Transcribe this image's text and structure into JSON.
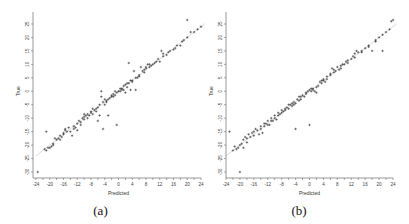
{
  "figure": {
    "captions": [
      "(a)",
      "(b)"
    ]
  },
  "chart_data": [
    {
      "type": "scatter",
      "title": "",
      "panel_label": "(a)",
      "xlabel": "Predicted",
      "ylabel": "True",
      "xlim": [
        -24,
        26
      ],
      "ylim": [
        -32,
        27
      ],
      "xticks": [
        -24,
        -20,
        -16,
        -12,
        -8,
        -4,
        0,
        4,
        8,
        12,
        16,
        20,
        24
      ],
      "yticks": [
        -30,
        -25,
        -20,
        -15,
        -10,
        -5,
        0,
        5,
        10,
        15,
        20,
        25
      ],
      "grid": false,
      "reference_line": "y = x",
      "points": [
        [
          -23.5,
          -30
        ],
        [
          -21,
          -15
        ],
        [
          -21.5,
          -21.5
        ],
        [
          -21,
          -22
        ],
        [
          -20.5,
          -21
        ],
        [
          -20,
          -21
        ],
        [
          -19.5,
          -20.5
        ],
        [
          -19,
          -20
        ],
        [
          -19,
          -19.5
        ],
        [
          -18,
          -18
        ],
        [
          -17.5,
          -17.5
        ],
        [
          -17,
          -16.5
        ],
        [
          -16.5,
          -17
        ],
        [
          -16,
          -16
        ],
        [
          -16,
          -15.5
        ],
        [
          -15.5,
          -14.5
        ],
        [
          -15,
          -15
        ],
        [
          -14.5,
          -13.5
        ],
        [
          -14,
          -15
        ],
        [
          -13.5,
          -16.5
        ],
        [
          -13,
          -14
        ],
        [
          -12.5,
          -13.5
        ],
        [
          -12,
          -12
        ],
        [
          -11.5,
          -11
        ],
        [
          -11,
          -11.5
        ],
        [
          -10.5,
          -10
        ],
        [
          -10,
          -8.5
        ],
        [
          -10,
          -10.5
        ],
        [
          -9.5,
          -9
        ],
        [
          -9,
          -10
        ],
        [
          -8.5,
          -9
        ],
        [
          -8,
          -8
        ],
        [
          -7.5,
          -8.5
        ],
        [
          -7,
          -7
        ],
        [
          -6.5,
          -7.5
        ],
        [
          -6,
          -6
        ],
        [
          -6,
          -11
        ],
        [
          -5.5,
          -5
        ],
        [
          -5.5,
          -9
        ],
        [
          -5,
          -2
        ],
        [
          -5,
          0
        ],
        [
          -4.5,
          -4
        ],
        [
          -4.5,
          -14
        ],
        [
          -4,
          -3
        ],
        [
          -3.5,
          -3.5
        ],
        [
          -3,
          -3
        ],
        [
          -3,
          -9
        ],
        [
          -2.5,
          -2.5
        ],
        [
          -2,
          -2
        ],
        [
          -1.5,
          -1
        ],
        [
          -1,
          -1.5
        ],
        [
          -0.5,
          -0.5
        ],
        [
          -0.5,
          -12.5
        ],
        [
          0,
          0
        ],
        [
          0.5,
          1
        ],
        [
          1,
          0.5
        ],
        [
          1.5,
          2
        ],
        [
          2,
          -0.5
        ],
        [
          2.5,
          1.5
        ],
        [
          3,
          3
        ],
        [
          3,
          10.5
        ],
        [
          3.5,
          4
        ],
        [
          3.5,
          0.5
        ],
        [
          4,
          4
        ],
        [
          4.5,
          7.5
        ],
        [
          5,
          5
        ],
        [
          5,
          0.5
        ],
        [
          6,
          6
        ],
        [
          6.5,
          9
        ],
        [
          7,
          7.5
        ],
        [
          7.5,
          8
        ],
        [
          8,
          8.5
        ],
        [
          8.5,
          10
        ],
        [
          9,
          10
        ],
        [
          9.5,
          9.5
        ],
        [
          10,
          10
        ],
        [
          11,
          11
        ],
        [
          11.5,
          12
        ],
        [
          12,
          11
        ],
        [
          12.5,
          15
        ],
        [
          13,
          13
        ],
        [
          14,
          13.5
        ],
        [
          15,
          15
        ],
        [
          16,
          15.5
        ],
        [
          17,
          17
        ],
        [
          18,
          17
        ],
        [
          19,
          19
        ],
        [
          20,
          20
        ],
        [
          20,
          26.5
        ],
        [
          21,
          22
        ],
        [
          22,
          22
        ],
        [
          23,
          23
        ],
        [
          24,
          24
        ],
        [
          -18.5,
          -17.5
        ],
        [
          -17,
          -18
        ],
        [
          -15.5,
          -14
        ],
        [
          -13,
          -13
        ],
        [
          -11,
          -12.5
        ],
        [
          -9,
          -8.5
        ],
        [
          -7.5,
          -6.5
        ],
        [
          -6.5,
          -6.5
        ],
        [
          -4,
          -5
        ],
        [
          -2,
          -1.5
        ],
        [
          -1,
          0
        ],
        [
          0.5,
          0
        ],
        [
          1.5,
          0.5
        ],
        [
          2.5,
          3
        ],
        [
          4,
          3.5
        ],
        [
          6,
          5.5
        ],
        [
          7.5,
          7
        ],
        [
          9,
          9
        ],
        [
          10.5,
          10.5
        ],
        [
          13,
          14
        ],
        [
          14.5,
          14.5
        ],
        [
          16.5,
          16
        ],
        [
          18.5,
          18.5
        ],
        [
          -12,
          -14.5
        ],
        [
          -10,
          -9.5
        ],
        [
          -8,
          -7.5
        ],
        [
          -3.5,
          -4
        ],
        [
          -1.5,
          -2
        ],
        [
          1,
          1
        ],
        [
          2,
          2.5
        ],
        [
          5.5,
          5
        ],
        [
          8,
          9
        ]
      ]
    },
    {
      "type": "scatter",
      "title": "",
      "panel_label": "(b)",
      "xlabel": "Predicted",
      "ylabel": "True",
      "xlim": [
        -24,
        25
      ],
      "ylim": [
        -32,
        28
      ],
      "xticks": [
        -24,
        -20,
        -16,
        -12,
        -8,
        -4,
        0,
        4,
        8,
        12,
        16,
        20,
        24
      ],
      "yticks": [
        -30,
        -25,
        -20,
        -15,
        -10,
        -5,
        0,
        5,
        10,
        15,
        20,
        25
      ],
      "grid": false,
      "reference_line": "y = x",
      "points": [
        [
          -20,
          -30
        ],
        [
          -23,
          -15
        ],
        [
          -22,
          -22
        ],
        [
          -21,
          -21.5
        ],
        [
          -20.5,
          -21
        ],
        [
          -20,
          -20
        ],
        [
          -19.5,
          -19.5
        ],
        [
          -19,
          -18
        ],
        [
          -19,
          -21
        ],
        [
          -18.5,
          -17
        ],
        [
          -18,
          -17.5
        ],
        [
          -17.5,
          -16
        ],
        [
          -17,
          -17
        ],
        [
          -16.5,
          -15.5
        ],
        [
          -16,
          -15
        ],
        [
          -15.5,
          -14
        ],
        [
          -15,
          -14.5
        ],
        [
          -14.5,
          -16
        ],
        [
          -14,
          -13
        ],
        [
          -13.5,
          -15.5
        ],
        [
          -13,
          -13
        ],
        [
          -12.5,
          -12
        ],
        [
          -12,
          -11
        ],
        [
          -11.5,
          -12.5
        ],
        [
          -11,
          -10
        ],
        [
          -10.5,
          -11
        ],
        [
          -10,
          -9
        ],
        [
          -9.5,
          -10.5
        ],
        [
          -9,
          -9
        ],
        [
          -8.5,
          -8.5
        ],
        [
          -8,
          -8
        ],
        [
          -7.5,
          -7.5
        ],
        [
          -7,
          -7
        ],
        [
          -6.5,
          -6
        ],
        [
          -6,
          -6.5
        ],
        [
          -5.5,
          -5
        ],
        [
          -5,
          -5.5
        ],
        [
          -4.5,
          -4
        ],
        [
          -4,
          -4.5
        ],
        [
          -4,
          -14
        ],
        [
          -3.5,
          -3
        ],
        [
          -3,
          -2
        ],
        [
          -2.5,
          -3
        ],
        [
          -2,
          -1.5
        ],
        [
          -1.5,
          -2
        ],
        [
          -1,
          -1
        ],
        [
          -0.5,
          0
        ],
        [
          0,
          0.5
        ],
        [
          0,
          -12.5
        ],
        [
          0.5,
          0
        ],
        [
          1,
          1
        ],
        [
          1.5,
          0
        ],
        [
          2,
          -0.5
        ],
        [
          2.5,
          2
        ],
        [
          3,
          3.5
        ],
        [
          3.5,
          4
        ],
        [
          4,
          4
        ],
        [
          4.5,
          3.5
        ],
        [
          5,
          4.5
        ],
        [
          6,
          6
        ],
        [
          6.5,
          8.5
        ],
        [
          7,
          7
        ],
        [
          7.5,
          7.5
        ],
        [
          8,
          9
        ],
        [
          8.5,
          8
        ],
        [
          9,
          9.5
        ],
        [
          9.5,
          10
        ],
        [
          10,
          10
        ],
        [
          10.5,
          11
        ],
        [
          11,
          11.5
        ],
        [
          12,
          12
        ],
        [
          12.5,
          13
        ],
        [
          13,
          14
        ],
        [
          13.5,
          15
        ],
        [
          14,
          14.5
        ],
        [
          15,
          15
        ],
        [
          16,
          16
        ],
        [
          17,
          17
        ],
        [
          18,
          15
        ],
        [
          19,
          19
        ],
        [
          20,
          20
        ],
        [
          21,
          15
        ],
        [
          22,
          22
        ],
        [
          23,
          23
        ],
        [
          23.5,
          26
        ],
        [
          24,
          26.5
        ],
        [
          -21.5,
          -20.5
        ],
        [
          -18,
          -19
        ],
        [
          -16,
          -16.5
        ],
        [
          -14,
          -14
        ],
        [
          -12,
          -12.5
        ],
        [
          -10,
          -10
        ],
        [
          -8,
          -7
        ],
        [
          -6,
          -5
        ],
        [
          -4.5,
          -5
        ],
        [
          -2.5,
          -2
        ],
        [
          -1,
          -0.5
        ],
        [
          1,
          0.5
        ],
        [
          2,
          1.5
        ],
        [
          3.5,
          3
        ],
        [
          5,
          5.5
        ],
        [
          7,
          8
        ],
        [
          9,
          8.5
        ],
        [
          11,
          10.5
        ],
        [
          13,
          12.5
        ],
        [
          15,
          14.5
        ],
        [
          17,
          16.5
        ],
        [
          19,
          18.5
        ],
        [
          21,
          21
        ],
        [
          -13,
          -12
        ],
        [
          -11,
          -11
        ],
        [
          -9,
          -8
        ],
        [
          -7,
          -6.5
        ],
        [
          -5,
          -4.5
        ],
        [
          -3,
          -3.5
        ],
        [
          0.5,
          1
        ],
        [
          4,
          4.5
        ],
        [
          6,
          6.5
        ]
      ]
    }
  ]
}
